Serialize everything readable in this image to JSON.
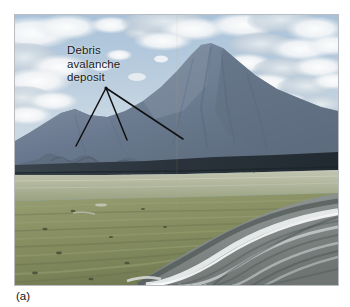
{
  "figure": {
    "caption": "(a)"
  },
  "annotation": {
    "label_text": "Debris\navalanche\ndeposit",
    "label_line_1": "Debris",
    "label_line_2": "avalanche",
    "label_line_3": "deposit",
    "leader_color": "#101010",
    "origin": {
      "x": 91,
      "y": 73
    },
    "targets": [
      {
        "x": 61,
        "y": 131
      },
      {
        "x": 112,
        "y": 125
      },
      {
        "x": 168,
        "y": 124
      }
    ]
  },
  "photo": {
    "frame": {
      "x": 15,
      "y": 15,
      "width": 323,
      "height": 270
    },
    "border_color": "#b9bcc0",
    "regions": {
      "sky_top_color": "#b9ccdd",
      "sky_mid_color": "#9fbbd4",
      "cloud_color": "#f2f4f5",
      "cloud_shadow_color": "#c3ccd6",
      "mountain_color": "#6f7f93",
      "mountain_shadow_color": "#5a6a7e",
      "mountain_highlight_color": "#8c9aab",
      "dark_ridge_color": "#2f3a42",
      "pale_plain_color": "#b9bda5",
      "green_plain_color": "#8b9468",
      "green_plain_dark_color": "#6d7551",
      "river_sediment_color": "#9aa0a0",
      "river_water_color": "#e8ecec",
      "river_dark_color": "#5d6462"
    },
    "horizon_y": 140,
    "peak": {
      "x": 193,
      "y": 45
    }
  }
}
